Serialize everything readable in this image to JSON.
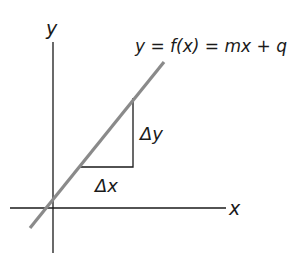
{
  "diagram": {
    "equation": "y = f(x) = mx + q",
    "axes": {
      "x_label": "x",
      "y_label": "y"
    },
    "triangle": {
      "delta_x_label": "Δx",
      "delta_y_label": "Δy"
    },
    "colors": {
      "line": "#8a8a8a",
      "axes": "#1a1a1a",
      "triangle": "#1a1a1a",
      "text": "#1a1a1a"
    }
  }
}
